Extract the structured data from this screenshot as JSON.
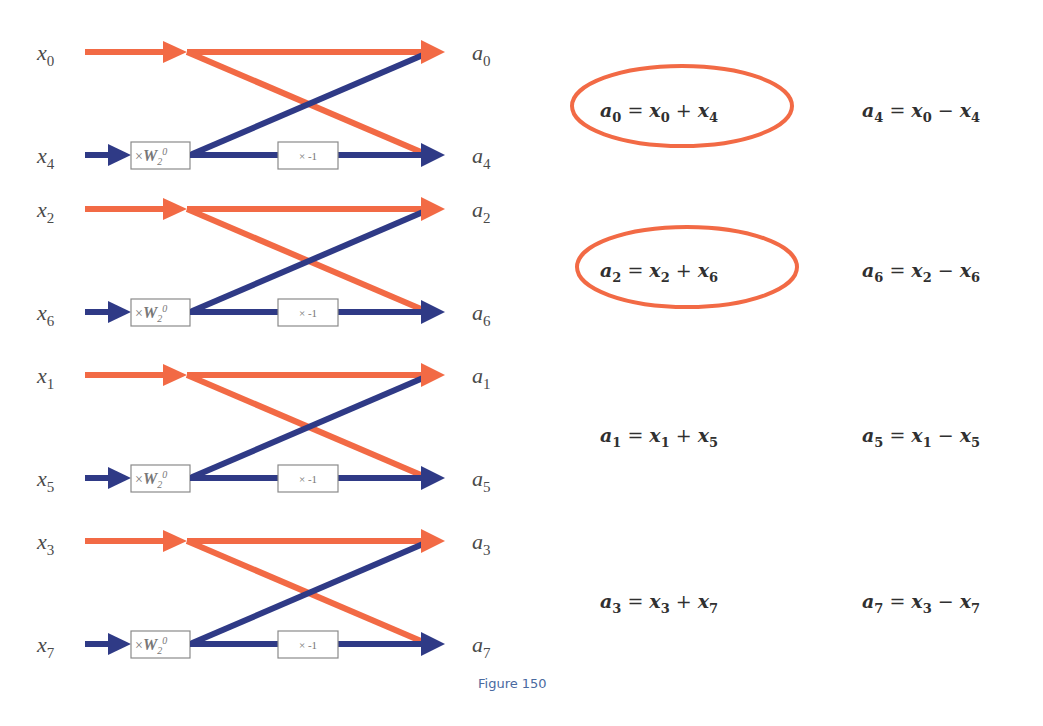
{
  "colors": {
    "orange": "#F26A45",
    "blue": "#2F3A86",
    "box_border": "#8a8a8a",
    "text": "#333333",
    "caption": "#4a6aa0"
  },
  "diagram": {
    "type": "FFT butterfly (radix-2, first stage, 8-point)",
    "twiddle_label": "×W₂⁰",
    "negate_label": "× -1",
    "butterflies": [
      {
        "top_in": "x",
        "top_in_sub": "0",
        "bottom_in": "x",
        "bottom_in_sub": "4",
        "top_out": "a",
        "top_out_sub": "0",
        "bottom_out": "a",
        "bottom_out_sub": "4"
      },
      {
        "top_in": "x",
        "top_in_sub": "2",
        "bottom_in": "x",
        "bottom_in_sub": "6",
        "top_out": "a",
        "top_out_sub": "2",
        "bottom_out": "a",
        "bottom_out_sub": "6"
      },
      {
        "top_in": "x",
        "top_in_sub": "1",
        "bottom_in": "x",
        "bottom_in_sub": "5",
        "top_out": "a",
        "top_out_sub": "1",
        "bottom_out": "a",
        "bottom_out_sub": "5"
      },
      {
        "top_in": "x",
        "top_in_sub": "3",
        "bottom_in": "x",
        "bottom_in_sub": "7",
        "top_out": "a",
        "top_out_sub": "3",
        "bottom_out": "a",
        "bottom_out_sub": "7"
      }
    ]
  },
  "equations": [
    {
      "sum": {
        "lhs": "a",
        "lhs_sub": "0",
        "x1": "x",
        "x1_sub": "0",
        "op": "+",
        "x2": "x",
        "x2_sub": "4"
      },
      "diff": {
        "lhs": "a",
        "lhs_sub": "4",
        "x1": "x",
        "x1_sub": "0",
        "op": "−",
        "x2": "x",
        "x2_sub": "4"
      },
      "sum_circled": true
    },
    {
      "sum": {
        "lhs": "a",
        "lhs_sub": "2",
        "x1": "x",
        "x1_sub": "2",
        "op": "+",
        "x2": "x",
        "x2_sub": "6"
      },
      "diff": {
        "lhs": "a",
        "lhs_sub": "6",
        "x1": "x",
        "x1_sub": "2",
        "op": "−",
        "x2": "x",
        "x2_sub": "6"
      },
      "sum_circled": true
    },
    {
      "sum": {
        "lhs": "a",
        "lhs_sub": "1",
        "x1": "x",
        "x1_sub": "1",
        "op": "+",
        "x2": "x",
        "x2_sub": "5"
      },
      "diff": {
        "lhs": "a",
        "lhs_sub": "5",
        "x1": "x",
        "x1_sub": "1",
        "op": "−",
        "x2": "x",
        "x2_sub": "5"
      },
      "sum_circled": false
    },
    {
      "sum": {
        "lhs": "a",
        "lhs_sub": "3",
        "x1": "x",
        "x1_sub": "3",
        "op": "+",
        "x2": "x",
        "x2_sub": "7"
      },
      "diff": {
        "lhs": "a",
        "lhs_sub": "7",
        "x1": "x",
        "x1_sub": "3",
        "op": "−",
        "x2": "x",
        "x2_sub": "7"
      },
      "sum_circled": false
    }
  ],
  "caption": "Figure 150"
}
